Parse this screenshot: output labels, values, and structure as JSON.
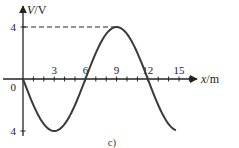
{
  "chart_data": {
    "type": "line",
    "title": "",
    "xlabel": "x/m",
    "ylabel": "V/V",
    "xlabel_var": "x",
    "xlabel_unit": "/m",
    "ylabel_var": "V",
    "ylabel_unit": "/V",
    "xlim": [
      -1.5,
      18
    ],
    "ylim": [
      -4.5,
      5.5
    ],
    "x_ticks": [
      3,
      6,
      9,
      12,
      15
    ],
    "x_tick_labels": [
      "3",
      "6",
      "9",
      "12",
      "15"
    ],
    "x_minor_step": 1,
    "y_tick_labels": [
      {
        "value": 4,
        "label": "4"
      },
      {
        "value": -4,
        "label": "4"
      }
    ],
    "origin_label": "0",
    "grid": false,
    "series": [
      {
        "name": "V(x)",
        "function": "-4*sin(2*pi*x/12)",
        "amplitude": 4,
        "wavelength": 12,
        "x_range": [
          0,
          14.7
        ],
        "color": "#3a3a3a"
      }
    ],
    "annotations": [
      {
        "type": "dashed-guide",
        "from": [
          0,
          4
        ],
        "to": [
          9,
          4
        ],
        "label": "peak"
      }
    ],
    "caption": "c)"
  }
}
